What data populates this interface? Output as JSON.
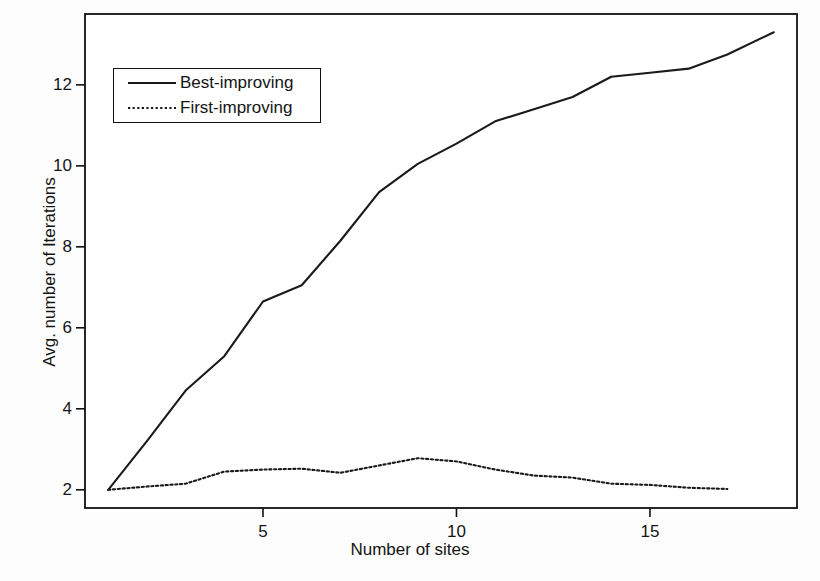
{
  "chart_data": {
    "type": "line",
    "title": "",
    "xlabel": "Number of sites",
    "ylabel": "Avg. number of Iterations",
    "xlim": [
      0.4,
      18.8
    ],
    "ylim": [
      1.55,
      13.75
    ],
    "xticks": [
      5,
      10,
      15
    ],
    "xtick_labels": [
      "5",
      "10",
      "15"
    ],
    "yticks": [
      2,
      4,
      6,
      8,
      10,
      12
    ],
    "ytick_labels": [
      "2",
      "4",
      "6",
      "8",
      "10",
      "12"
    ],
    "grid": false,
    "legend_position": "upper left",
    "series": [
      {
        "name": "Best-improving",
        "style": "solid",
        "color": "#1a1a1a",
        "x": [
          1,
          2,
          3,
          4,
          5,
          6,
          7,
          8,
          9,
          10,
          11,
          12,
          13,
          14,
          15,
          16,
          17,
          18.2
        ],
        "values": [
          2.0,
          3.2,
          4.45,
          5.3,
          6.65,
          7.05,
          8.15,
          9.35,
          10.05,
          10.55,
          11.1,
          11.4,
          11.7,
          12.2,
          12.3,
          12.4,
          12.75,
          13.3
        ]
      },
      {
        "name": "First-improving",
        "style": "dotted",
        "color": "#1a1a1a",
        "x": [
          1,
          2,
          3,
          4,
          5,
          6,
          7,
          8,
          9,
          10,
          11,
          12,
          13,
          14,
          15,
          16,
          17
        ],
        "values": [
          2.0,
          2.08,
          2.15,
          2.45,
          2.5,
          2.52,
          2.42,
          2.6,
          2.78,
          2.7,
          2.5,
          2.35,
          2.3,
          2.15,
          2.12,
          2.05,
          2.02
        ]
      }
    ]
  },
  "legend": {
    "entries": [
      {
        "label": "Best-improving"
      },
      {
        "label": "First-improving"
      }
    ]
  },
  "axes": {
    "x_label": "Number of sites",
    "y_label": "Avg. number of Iterations",
    "xtick_0": "5",
    "xtick_1": "10",
    "xtick_2": "15",
    "ytick_0": "2",
    "ytick_1": "4",
    "ytick_2": "6",
    "ytick_3": "8",
    "ytick_4": "10",
    "ytick_5": "12"
  },
  "colors": {
    "line": "#1a1a1a",
    "frame": "#111111",
    "background": "#fdfdfd"
  }
}
